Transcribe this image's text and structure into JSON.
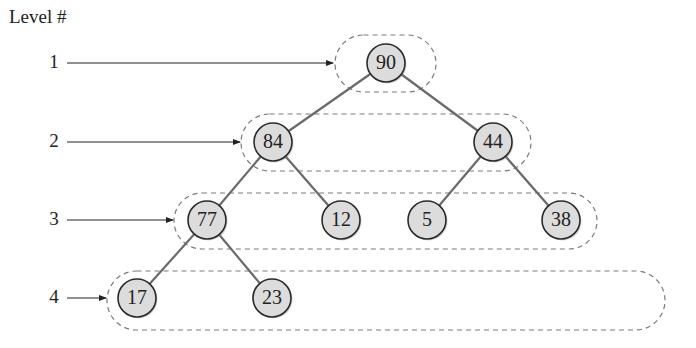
{
  "diagram": {
    "title": "Level #",
    "levels": [
      {
        "number": "1",
        "y": 63,
        "arrow_end": 333,
        "box": {
          "x": 335,
          "y": 35,
          "w": 101,
          "h": 57
        }
      },
      {
        "number": "2",
        "y": 142,
        "arrow_end": 240,
        "box": {
          "x": 241,
          "y": 114,
          "w": 290,
          "h": 57
        }
      },
      {
        "number": "3",
        "y": 220,
        "arrow_end": 173,
        "box": {
          "x": 174,
          "y": 193,
          "w": 423,
          "h": 56
        }
      },
      {
        "number": "4",
        "y": 298,
        "arrow_end": 106,
        "box": {
          "x": 107,
          "y": 271,
          "w": 558,
          "h": 59
        }
      }
    ],
    "nodes": [
      {
        "id": "n90",
        "value": "90",
        "x": 386,
        "y": 63,
        "level": 1
      },
      {
        "id": "n84",
        "value": "84",
        "x": 273,
        "y": 142,
        "level": 2
      },
      {
        "id": "n44",
        "value": "44",
        "x": 493,
        "y": 142,
        "level": 2
      },
      {
        "id": "n77",
        "value": "77",
        "x": 207,
        "y": 220,
        "level": 3
      },
      {
        "id": "n12",
        "value": "12",
        "x": 341,
        "y": 220,
        "level": 3
      },
      {
        "id": "n5",
        "value": "5",
        "x": 427,
        "y": 220,
        "level": 3
      },
      {
        "id": "n38",
        "value": "38",
        "x": 561,
        "y": 220,
        "level": 3
      },
      {
        "id": "n17",
        "value": "17",
        "x": 137,
        "y": 298,
        "level": 4
      },
      {
        "id": "n23",
        "value": "23",
        "x": 272,
        "y": 298,
        "level": 4
      }
    ],
    "edges": [
      [
        "n90",
        "n84"
      ],
      [
        "n90",
        "n44"
      ],
      [
        "n84",
        "n77"
      ],
      [
        "n84",
        "n12"
      ],
      [
        "n44",
        "n5"
      ],
      [
        "n44",
        "n38"
      ],
      [
        "n77",
        "n17"
      ],
      [
        "n77",
        "n23"
      ]
    ],
    "colors": {
      "node_fill": "#dcdcdc",
      "node_stroke": "#2a2a2a",
      "edge": "#6a6a6a",
      "dash": "#7a7a7a",
      "text": "#222222"
    }
  }
}
